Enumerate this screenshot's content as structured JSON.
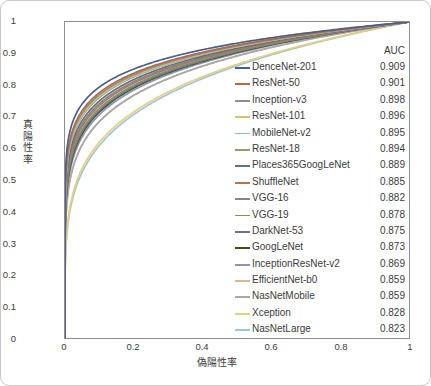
{
  "chart_data": {
    "type": "line",
    "title": "",
    "xlabel": "偽陽性率",
    "ylabel": "真陽性率",
    "xlim": [
      0,
      1
    ],
    "ylim": [
      0,
      1
    ],
    "grid": false,
    "legend_position": "inside-right",
    "legend_value_header": "AUC",
    "xticks": [
      "0",
      "0.2",
      "0.4",
      "0.6",
      "0.8",
      "1"
    ],
    "xtick_values": [
      0,
      0.2,
      0.4,
      0.6,
      0.8,
      1
    ],
    "yticks": [
      "0",
      "0.1",
      "0.2",
      "0.3",
      "0.4",
      "0.5",
      "0.6",
      "0.7",
      "0.8",
      "0.9",
      "1"
    ],
    "ytick_values": [
      0,
      0.1,
      0.2,
      0.3,
      0.4,
      0.5,
      0.6,
      0.7,
      0.8,
      0.9,
      1
    ],
    "series": [
      {
        "name": "DenceNet-201",
        "auc": "0.909",
        "auc_value": 0.909,
        "color": "#4a5f8e"
      },
      {
        "name": "ResNet-50",
        "auc": "0.901",
        "auc_value": 0.901,
        "color": "#b6693f"
      },
      {
        "name": "Inception-v3",
        "auc": "0.898",
        "auc_value": 0.898,
        "color": "#8f8f8f"
      },
      {
        "name": "ResNet-101",
        "auc": "0.896",
        "auc_value": 0.896,
        "color": "#d9c06a"
      },
      {
        "name": "MobileNet-v2",
        "auc": "0.895",
        "auc_value": 0.895,
        "color": "#87bdd8"
      },
      {
        "name": "ResNet-18",
        "auc": "0.894",
        "auc_value": 0.894,
        "color": "#8aa468"
      },
      {
        "name": "Places365GoogLeNet",
        "auc": "0.889",
        "auc_value": 0.889,
        "color": "#5a6e96"
      },
      {
        "name": "ShuffleNet",
        "auc": "0.885",
        "auc_value": 0.885,
        "color": "#b4764c"
      },
      {
        "name": "VGG-16",
        "auc": "0.882",
        "auc_value": 0.882,
        "color": "#7d8894"
      },
      {
        "name": "VGG-19",
        "auc": "0.878",
        "auc_value": 0.878,
        "color": "#8d8f4e"
      },
      {
        "name": "DarkNet-53",
        "auc": "0.875",
        "auc_value": 0.875,
        "color": "#6b7296"
      },
      {
        "name": "GoogLeNet",
        "auc": "0.873",
        "auc_value": 0.873,
        "color": "#3d4a23"
      },
      {
        "name": "InceptionResNet-v2",
        "auc": "0.869",
        "auc_value": 0.869,
        "color": "#8e92b3"
      },
      {
        "name": "EfficientNet-b0",
        "auc": "0.859",
        "auc_value": 0.859,
        "color": "#dfb58c"
      },
      {
        "name": "NasNetMobile",
        "auc": "0.859",
        "auc_value": 0.859,
        "color": "#a8a8a8"
      },
      {
        "name": "Xception",
        "auc": "0.828",
        "auc_value": 0.828,
        "color": "#e8cf7a"
      },
      {
        "name": "NasNetLarge",
        "auc": "0.823",
        "auc_value": 0.823,
        "color": "#9dc4df"
      }
    ]
  }
}
